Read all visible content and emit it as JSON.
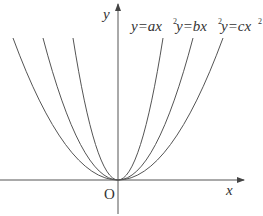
{
  "diagram": {
    "axes": {
      "x_label": "x",
      "y_label": "y",
      "origin_label": "O"
    },
    "curves": [
      {
        "name": "a",
        "label_prefix": "y=",
        "coef": "a",
        "label_suffix": "x",
        "exp": "2"
      },
      {
        "name": "b",
        "label_prefix": "y=",
        "coef": "b",
        "label_suffix": "x",
        "exp": "2"
      },
      {
        "name": "c",
        "label_prefix": "y=",
        "coef": "c",
        "label_suffix": "x",
        "exp": "2"
      }
    ],
    "stroke_color": "#555555",
    "label_color": "#333333"
  }
}
